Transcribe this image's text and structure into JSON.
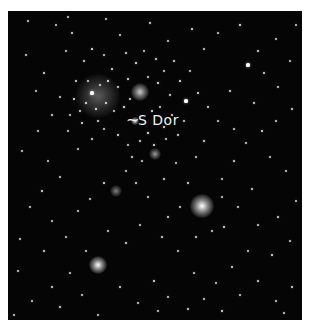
{
  "photo": {
    "background": "#050505",
    "label": {
      "pointer": "~",
      "text": "S Dor",
      "color": "#f2f2f2",
      "x": 130,
      "y": 102,
      "pointer_x": 118,
      "pointer_y": 101
    },
    "glows": [
      {
        "name": "cluster-glow-right",
        "x": 194,
        "y": 195,
        "r": 12,
        "intensity": 1.0
      },
      {
        "name": "bright-star-lower-left",
        "x": 90,
        "y": 254,
        "r": 9,
        "intensity": 1.0
      },
      {
        "name": "upper-cluster-knot",
        "x": 132,
        "y": 81,
        "r": 9,
        "intensity": 0.8
      },
      {
        "name": "nebulous-region",
        "x": 90,
        "y": 85,
        "r": 22,
        "intensity": 0.35
      },
      {
        "name": "sdor-star",
        "x": 127,
        "y": 110,
        "r": 4,
        "intensity": 0.9
      },
      {
        "name": "lower-knot-left",
        "x": 147,
        "y": 143,
        "r": 6,
        "intensity": 0.6
      },
      {
        "name": "knot-center",
        "x": 108,
        "y": 180,
        "r": 6,
        "intensity": 0.5
      }
    ],
    "stars": [
      [
        20,
        10,
        1.2
      ],
      [
        48,
        14,
        1
      ],
      [
        64,
        22,
        1.4
      ],
      [
        98,
        8,
        1.2
      ],
      [
        112,
        24,
        1
      ],
      [
        142,
        12,
        1.4
      ],
      [
        160,
        30,
        1.2
      ],
      [
        184,
        18,
        1.6
      ],
      [
        210,
        22,
        1
      ],
      [
        232,
        14,
        1.8
      ],
      [
        250,
        40,
        1.4
      ],
      [
        268,
        28,
        1
      ],
      [
        282,
        50,
        1.2
      ],
      [
        240,
        54,
        2
      ],
      [
        256,
        62,
        1.4
      ],
      [
        270,
        76,
        1.2
      ],
      [
        18,
        44,
        1.2
      ],
      [
        36,
        62,
        1.6
      ],
      [
        28,
        80,
        1
      ],
      [
        58,
        40,
        1.2
      ],
      [
        76,
        50,
        1.4
      ],
      [
        84,
        38,
        1.8
      ],
      [
        96,
        44,
        1.2
      ],
      [
        104,
        58,
        1.6
      ],
      [
        118,
        42,
        1.4
      ],
      [
        128,
        52,
        1.8
      ],
      [
        136,
        40,
        1.2
      ],
      [
        148,
        48,
        1.6
      ],
      [
        156,
        60,
        1.2
      ],
      [
        166,
        50,
        1.4
      ],
      [
        172,
        70,
        1.8
      ],
      [
        182,
        60,
        1.2
      ],
      [
        190,
        82,
        1.6
      ],
      [
        200,
        96,
        1.4
      ],
      [
        178,
        90,
        2
      ],
      [
        162,
        84,
        1.4
      ],
      [
        150,
        72,
        1.8
      ],
      [
        140,
        66,
        1.2
      ],
      [
        120,
        68,
        1.6
      ],
      [
        110,
        76,
        1.4
      ],
      [
        100,
        70,
        1.8
      ],
      [
        92,
        74,
        1.2
      ],
      [
        84,
        82,
        2
      ],
      [
        78,
        92,
        1.6
      ],
      [
        72,
        100,
        1.4
      ],
      [
        88,
        98,
        1.8
      ],
      [
        98,
        92,
        1.6
      ],
      [
        106,
        100,
        1.2
      ],
      [
        116,
        96,
        1.8
      ],
      [
        122,
        88,
        1.4
      ],
      [
        144,
        100,
        1.6
      ],
      [
        152,
        96,
        1.2
      ],
      [
        164,
        104,
        1.4
      ],
      [
        176,
        110,
        1.2
      ],
      [
        156,
        116,
        1.6
      ],
      [
        140,
        122,
        1.8
      ],
      [
        132,
        130,
        1.4
      ],
      [
        146,
        134,
        1.6
      ],
      [
        158,
        128,
        1.2
      ],
      [
        170,
        124,
        1.4
      ],
      [
        120,
        134,
        1.2
      ],
      [
        110,
        124,
        1.6
      ],
      [
        96,
        118,
        1.2
      ],
      [
        84,
        128,
        1.4
      ],
      [
        70,
        138,
        1.2
      ],
      [
        60,
        120,
        1
      ],
      [
        44,
        104,
        1.4
      ],
      [
        30,
        120,
        1.2
      ],
      [
        14,
        140,
        1.2
      ],
      [
        40,
        150,
        1
      ],
      [
        52,
        166,
        1.2
      ],
      [
        34,
        180,
        1.6
      ],
      [
        22,
        196,
        1.2
      ],
      [
        44,
        210,
        1
      ],
      [
        12,
        228,
        1.2
      ],
      [
        36,
        240,
        1.4
      ],
      [
        58,
        226,
        1.2
      ],
      [
        70,
        200,
        1
      ],
      [
        82,
        188,
        1.2
      ],
      [
        96,
        172,
        1.6
      ],
      [
        118,
        160,
        1.2
      ],
      [
        128,
        172,
        1.4
      ],
      [
        140,
        186,
        1.2
      ],
      [
        156,
        168,
        1.4
      ],
      [
        168,
        152,
        1.2
      ],
      [
        180,
        172,
        1.6
      ],
      [
        214,
        168,
        1.2
      ],
      [
        226,
        150,
        1.4
      ],
      [
        238,
        132,
        1.2
      ],
      [
        254,
        120,
        1.6
      ],
      [
        268,
        110,
        1.2
      ],
      [
        284,
        98,
        1.4
      ],
      [
        262,
        146,
        1.2
      ],
      [
        278,
        160,
        1
      ],
      [
        244,
        178,
        1.4
      ],
      [
        230,
        196,
        1.2
      ],
      [
        216,
        216,
        1.6
      ],
      [
        250,
        214,
        1.2
      ],
      [
        270,
        206,
        1.4
      ],
      [
        288,
        190,
        1
      ],
      [
        282,
        230,
        1.2
      ],
      [
        264,
        244,
        1.6
      ],
      [
        240,
        240,
        1.2
      ],
      [
        224,
        256,
        1.4
      ],
      [
        208,
        272,
        1.2
      ],
      [
        186,
        262,
        1
      ],
      [
        170,
        240,
        1.2
      ],
      [
        154,
        226,
        1.4
      ],
      [
        132,
        214,
        1.2
      ],
      [
        118,
        232,
        1.4
      ],
      [
        100,
        220,
        1.2
      ],
      [
        78,
        240,
        1
      ],
      [
        62,
        262,
        1.2
      ],
      [
        44,
        276,
        1.4
      ],
      [
        24,
        290,
        1.2
      ],
      [
        52,
        296,
        1.6
      ],
      [
        74,
        284,
        1.2
      ],
      [
        112,
        276,
        1.4
      ],
      [
        130,
        292,
        1.2
      ],
      [
        146,
        270,
        1.6
      ],
      [
        160,
        286,
        1.2
      ],
      [
        180,
        298,
        1.4
      ],
      [
        196,
        288,
        1.2
      ],
      [
        214,
        300,
        1.6
      ],
      [
        232,
        284,
        1.2
      ],
      [
        250,
        270,
        1.4
      ],
      [
        268,
        290,
        1.2
      ],
      [
        284,
        276,
        1.6
      ],
      [
        276,
        302,
        1.2
      ],
      [
        150,
        300,
        1
      ],
      [
        90,
        304,
        1.2
      ],
      [
        6,
        304,
        1
      ],
      [
        10,
        260,
        1.2
      ],
      [
        288,
        14,
        1
      ],
      [
        60,
        6,
        1
      ],
      [
        196,
        38,
        1.2
      ],
      [
        222,
        80,
        1.4
      ],
      [
        210,
        110,
        1.2
      ],
      [
        196,
        130,
        1.6
      ],
      [
        226,
        118,
        1.2
      ],
      [
        246,
        92,
        1.4
      ],
      [
        188,
        146,
        1.2
      ],
      [
        172,
        196,
        1.2
      ],
      [
        160,
        206,
        1.4
      ],
      [
        214,
        186,
        1.2
      ],
      [
        204,
        220,
        1.2
      ],
      [
        188,
        226,
        1.4
      ],
      [
        68,
        70,
        1.4
      ],
      [
        52,
        86,
        1.2
      ],
      [
        66,
        88,
        1.8
      ],
      [
        80,
        70,
        1.2
      ],
      [
        74,
        112,
        1.6
      ],
      [
        62,
        104,
        1.2
      ],
      [
        90,
        110,
        1.4
      ],
      [
        134,
        150,
        1.2
      ],
      [
        124,
        146,
        1.4
      ]
    ]
  }
}
